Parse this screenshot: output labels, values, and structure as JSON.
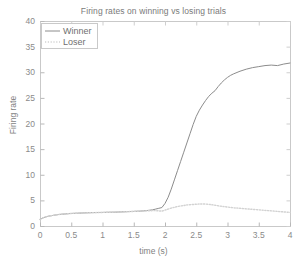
{
  "chart_data": {
    "type": "line",
    "title": "Firing rates on winning vs losing trials",
    "xlabel": "time (s)",
    "ylabel": "Firing rate",
    "xlim": [
      0,
      4
    ],
    "ylim": [
      0,
      40
    ],
    "grid": false,
    "legend_position": "top-left",
    "xticks": [
      0,
      0.5,
      1,
      1.5,
      2,
      2.5,
      3,
      3.5,
      4
    ],
    "xticklabels": [
      "0",
      "0.5",
      "1",
      "1.5",
      "2",
      "2.5",
      "3",
      "3.5",
      "4"
    ],
    "yticks": [
      0,
      5,
      10,
      15,
      20,
      25,
      30,
      35,
      40
    ],
    "yticklabels": [
      "0",
      "5",
      "10",
      "15",
      "20",
      "25",
      "30",
      "35",
      "40"
    ],
    "x": [
      0,
      0.05,
      0.1,
      0.15,
      0.2,
      0.25,
      0.3,
      0.35,
      0.4,
      0.45,
      0.5,
      0.6,
      0.7,
      0.8,
      0.9,
      1.0,
      1.1,
      1.2,
      1.3,
      1.4,
      1.5,
      1.6,
      1.7,
      1.8,
      1.85,
      1.9,
      1.95,
      2.0,
      2.05,
      2.1,
      2.15,
      2.2,
      2.25,
      2.3,
      2.35,
      2.4,
      2.45,
      2.5,
      2.55,
      2.6,
      2.65,
      2.7,
      2.75,
      2.8,
      2.85,
      2.9,
      2.95,
      3.0,
      3.05,
      3.1,
      3.2,
      3.3,
      3.4,
      3.5,
      3.6,
      3.7,
      3.8,
      3.9,
      4.0
    ],
    "series": [
      {
        "name": "Winner",
        "color": "#8c8c8c",
        "style": "solid",
        "values": [
          1.3,
          1.6,
          1.8,
          1.95,
          2.05,
          2.15,
          2.25,
          2.3,
          2.35,
          2.4,
          2.45,
          2.5,
          2.55,
          2.6,
          2.62,
          2.65,
          2.68,
          2.7,
          2.75,
          2.8,
          2.85,
          2.9,
          3.0,
          3.15,
          3.3,
          3.45,
          3.6,
          4.4,
          5.6,
          7.2,
          9.0,
          10.8,
          12.6,
          14.4,
          16.2,
          18.0,
          19.8,
          21.4,
          22.6,
          23.6,
          24.5,
          25.3,
          25.9,
          26.4,
          27.2,
          27.9,
          28.5,
          29.0,
          29.4,
          29.7,
          30.2,
          30.6,
          30.9,
          31.1,
          31.3,
          31.4,
          31.3,
          31.6,
          31.8
        ]
      },
      {
        "name": "Loser",
        "color": "#d2d2d2",
        "style": "dotted",
        "values": [
          1.3,
          1.6,
          1.8,
          1.95,
          2.05,
          2.15,
          2.25,
          2.3,
          2.35,
          2.4,
          2.45,
          2.5,
          2.55,
          2.6,
          2.62,
          2.65,
          2.68,
          2.7,
          2.75,
          2.8,
          2.85,
          2.9,
          2.95,
          3.0,
          3.0,
          2.95,
          2.9,
          3.1,
          3.3,
          3.5,
          3.65,
          3.8,
          3.9,
          4.0,
          4.1,
          4.15,
          4.2,
          4.25,
          4.3,
          4.3,
          4.28,
          4.22,
          4.15,
          4.05,
          3.95,
          3.85,
          3.78,
          3.7,
          3.62,
          3.55,
          3.45,
          3.35,
          3.25,
          3.15,
          3.05,
          2.95,
          2.85,
          2.75,
          2.65
        ]
      }
    ]
  },
  "legend": {
    "entries": [
      {
        "label": "Winner"
      },
      {
        "label": "Loser"
      }
    ]
  },
  "axes": {
    "plot_box": {
      "left": 40,
      "top": 21,
      "right": 290,
      "bottom": 226
    }
  }
}
